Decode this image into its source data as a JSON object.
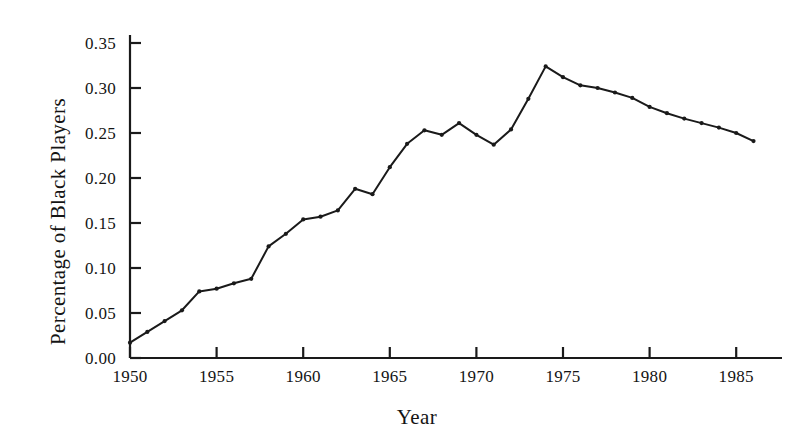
{
  "chart_data": {
    "type": "line",
    "title": "",
    "xlabel": "Year",
    "ylabel": "Percentage of Black Players",
    "xlim": [
      1950,
      1986
    ],
    "ylim": [
      0.0,
      0.355
    ],
    "grid": false,
    "legend": null,
    "marker": "dot",
    "line_color": "#1a1a1a",
    "x_ticks": [
      1950,
      1955,
      1960,
      1965,
      1970,
      1975,
      1980,
      1985
    ],
    "x_tick_labels": [
      "1950",
      "1955",
      "1960",
      "1965",
      "1970",
      "1975",
      "1980",
      "1985"
    ],
    "y_ticks": [
      0.0,
      0.05,
      0.1,
      0.15,
      0.2,
      0.25,
      0.3,
      0.35
    ],
    "y_tick_labels": [
      "0.00",
      "0.05",
      "0.10",
      "0.15",
      "0.20",
      "0.25",
      "0.30",
      "0.35"
    ],
    "x": [
      1950,
      1951,
      1952,
      1953,
      1954,
      1955,
      1956,
      1957,
      1958,
      1959,
      1960,
      1961,
      1962,
      1963,
      1964,
      1965,
      1966,
      1967,
      1968,
      1969,
      1970,
      1971,
      1972,
      1973,
      1974,
      1975,
      1976,
      1977,
      1978,
      1979,
      1980,
      1981,
      1982,
      1983,
      1984,
      1985,
      1986
    ],
    "values": [
      0.017,
      0.029,
      0.041,
      0.053,
      0.074,
      0.077,
      0.083,
      0.088,
      0.124,
      0.138,
      0.154,
      0.157,
      0.164,
      0.188,
      0.182,
      0.212,
      0.238,
      0.253,
      0.248,
      0.261,
      0.248,
      0.237,
      0.254,
      0.288,
      0.324,
      0.312,
      0.303,
      0.3,
      0.295,
      0.289,
      0.279,
      0.272,
      0.266,
      0.261,
      0.256,
      0.25,
      0.241
    ]
  },
  "axes": {
    "y_title": "Percentage of Black Players",
    "x_title": "Year"
  }
}
